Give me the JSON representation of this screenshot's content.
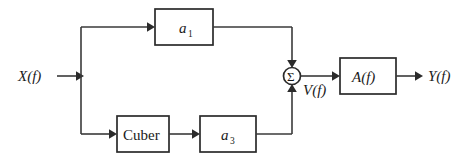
{
  "diagram": {
    "type": "block-diagram",
    "background_color": "#ffffff",
    "line_color": "#2b2b2b",
    "wire_color": "#3a3a3a",
    "text_color": "#1a1a1a",
    "signals": {
      "input_label": "X(f)",
      "intermediate_label": "V(f)",
      "output_label": "Y(f)"
    },
    "blocks": [
      {
        "id": "a1",
        "label": "a",
        "subscript": "1",
        "style": "italic",
        "branch": "upper"
      },
      {
        "id": "cuber",
        "label": "Cuber",
        "subscript": "",
        "style": "upright",
        "branch": "lower"
      },
      {
        "id": "a3",
        "label": "a",
        "subscript": "3",
        "style": "italic",
        "branch": "lower"
      },
      {
        "id": "af",
        "label": "A(f)",
        "subscript": "",
        "style": "italic",
        "branch": "output"
      }
    ],
    "summing_junction": {
      "symbol": "Σ",
      "inputs": [
        "upper-branch",
        "lower-branch"
      ],
      "output": "V(f)"
    }
  }
}
